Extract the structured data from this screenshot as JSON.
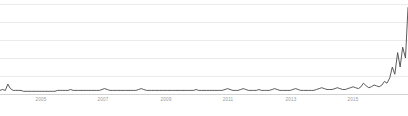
{
  "chart_data": {
    "type": "line",
    "title": "",
    "subtitle": "",
    "xlabel": "",
    "ylabel": "",
    "grid": true,
    "legend": false,
    "legend_position": "none",
    "line_color": "#4a4a4a",
    "grid_color": "#ebebeb",
    "axis_color": "#d2d2d2",
    "background_color": "#ffffff",
    "xlim": [
      2004.0,
      2017.0
    ],
    "ylim": [
      0,
      100
    ],
    "y_gridline_values": [
      100,
      80,
      60,
      40,
      20,
      0
    ],
    "xtick_labels": [
      "2005",
      "2007",
      "2009",
      "2011",
      "2013",
      "2015"
    ],
    "xtick_values": [
      2005,
      2007,
      2009,
      2011,
      2013,
      2015
    ],
    "series": [
      {
        "name": "interest over time",
        "x": [
          2004.0,
          2004.08,
          2004.17,
          2004.25,
          2004.33,
          2004.42,
          2004.5,
          2004.58,
          2004.67,
          2004.75,
          2004.83,
          2004.92,
          2005.0,
          2005.08,
          2005.17,
          2005.25,
          2005.33,
          2005.42,
          2005.5,
          2005.58,
          2005.67,
          2005.75,
          2005.83,
          2005.92,
          2006.0,
          2006.08,
          2006.17,
          2006.25,
          2006.33,
          2006.42,
          2006.5,
          2006.58,
          2006.67,
          2006.75,
          2006.83,
          2006.92,
          2007.0,
          2007.08,
          2007.17,
          2007.25,
          2007.33,
          2007.42,
          2007.5,
          2007.58,
          2007.67,
          2007.75,
          2007.83,
          2007.92,
          2008.0,
          2008.08,
          2008.17,
          2008.25,
          2008.33,
          2008.42,
          2008.5,
          2008.58,
          2008.67,
          2008.75,
          2008.83,
          2008.92,
          2009.0,
          2009.08,
          2009.17,
          2009.25,
          2009.33,
          2009.42,
          2009.5,
          2009.58,
          2009.67,
          2009.75,
          2009.83,
          2009.92,
          2010.0,
          2010.08,
          2010.17,
          2010.25,
          2010.33,
          2010.42,
          2010.5,
          2010.58,
          2010.67,
          2010.75,
          2010.83,
          2010.92,
          2011.0,
          2011.08,
          2011.17,
          2011.25,
          2011.33,
          2011.42,
          2011.5,
          2011.58,
          2011.67,
          2011.75,
          2011.83,
          2011.92,
          2012.0,
          2012.08,
          2012.17,
          2012.25,
          2012.33,
          2012.42,
          2012.5,
          2012.58,
          2012.67,
          2012.75,
          2012.83,
          2012.92,
          2013.0,
          2013.08,
          2013.17,
          2013.25,
          2013.33,
          2013.42,
          2013.5,
          2013.58,
          2013.67,
          2013.75,
          2013.83,
          2013.92,
          2014.0,
          2014.08,
          2014.17,
          2014.25,
          2014.33,
          2014.42,
          2014.5,
          2014.58,
          2014.67,
          2014.75,
          2014.83,
          2014.92,
          2015.0,
          2015.08,
          2015.17,
          2015.25,
          2015.33,
          2015.42,
          2015.5,
          2015.58,
          2015.67,
          2015.75,
          2015.83,
          2015.92,
          2016.0,
          2016.08,
          2016.17,
          2016.25,
          2016.33,
          2016.42,
          2016.5,
          2016.58,
          2016.67,
          2016.75,
          2016.83,
          2016.92,
          2017.0
        ],
        "values": [
          4,
          5,
          4,
          11,
          6,
          4,
          4,
          4,
          4,
          3,
          3,
          3,
          3,
          3,
          3,
          3,
          3,
          3,
          3,
          3,
          3,
          3,
          4,
          4,
          4,
          4,
          4,
          5,
          4,
          4,
          4,
          4,
          4,
          4,
          4,
          4,
          4,
          4,
          4,
          5,
          6,
          5,
          4,
          4,
          4,
          4,
          4,
          4,
          4,
          4,
          4,
          4,
          4,
          5,
          6,
          5,
          4,
          4,
          4,
          4,
          4,
          4,
          4,
          4,
          4,
          4,
          4,
          4,
          4,
          4,
          4,
          4,
          4,
          4,
          4,
          5,
          4,
          4,
          4,
          4,
          4,
          4,
          4,
          4,
          4,
          4,
          5,
          6,
          5,
          4,
          4,
          4,
          5,
          6,
          5,
          4,
          4,
          4,
          4,
          5,
          4,
          4,
          4,
          4,
          5,
          6,
          5,
          4,
          4,
          4,
          4,
          4,
          5,
          6,
          5,
          4,
          4,
          4,
          4,
          4,
          4,
          5,
          6,
          7,
          6,
          5,
          5,
          5,
          6,
          7,
          6,
          5,
          5,
          6,
          7,
          8,
          7,
          6,
          8,
          12,
          9,
          7,
          8,
          10,
          9,
          8,
          10,
          14,
          12,
          18,
          30,
          22,
          46,
          30,
          52,
          40,
          96
        ]
      }
    ]
  }
}
